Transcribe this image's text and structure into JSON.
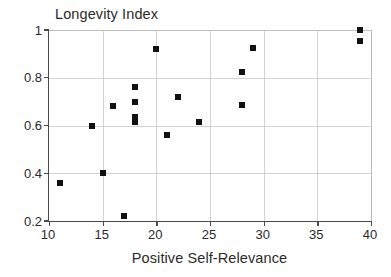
{
  "chart_data": {
    "type": "scatter",
    "title": "Longevity Index",
    "xlabel": "Positive Self-Relevance",
    "ylabel": "",
    "xlim": [
      10,
      40
    ],
    "ylim": [
      0.2,
      1.0
    ],
    "xticks": [
      10,
      15,
      20,
      25,
      30,
      35,
      40
    ],
    "xtick_labels": [
      "10",
      "15",
      "20",
      "25",
      "30",
      "35",
      "40"
    ],
    "yticks": [
      0.2,
      0.4,
      0.6,
      0.8,
      1
    ],
    "ytick_labels": [
      "0.2",
      "0.4",
      "0.6",
      "0.8",
      "1"
    ],
    "grid": true,
    "legend": null,
    "marker": "filled-square",
    "marker_color": "#111111",
    "points": [
      {
        "x": 11,
        "y": 0.36
      },
      {
        "x": 14,
        "y": 0.6
      },
      {
        "x": 15,
        "y": 0.4
      },
      {
        "x": 16,
        "y": 0.68
      },
      {
        "x": 17,
        "y": 0.22
      },
      {
        "x": 18,
        "y": 0.76
      },
      {
        "x": 18,
        "y": 0.7
      },
      {
        "x": 18,
        "y": 0.635
      },
      {
        "x": 18,
        "y": 0.615
      },
      {
        "x": 20,
        "y": 0.92
      },
      {
        "x": 21,
        "y": 0.56
      },
      {
        "x": 22,
        "y": 0.72
      },
      {
        "x": 24,
        "y": 0.615
      },
      {
        "x": 28,
        "y": 0.825
      },
      {
        "x": 28,
        "y": 0.685
      },
      {
        "x": 29,
        "y": 0.925
      },
      {
        "x": 39,
        "y": 1.0
      },
      {
        "x": 39,
        "y": 0.955
      }
    ]
  },
  "colors": {
    "marker": "#111111",
    "grid": "#d2d2d2",
    "axis": "#4a4a4a",
    "text": "#2b2b2b",
    "background": "#ffffff"
  }
}
